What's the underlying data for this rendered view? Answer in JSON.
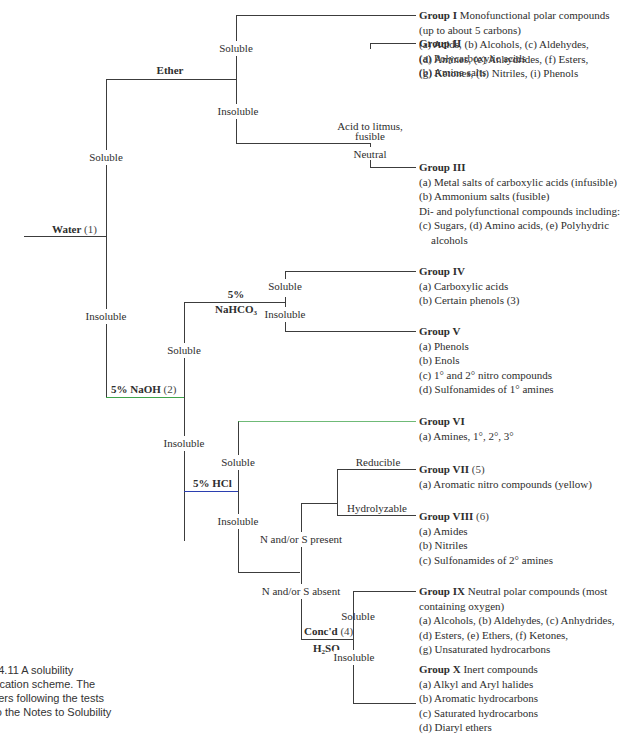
{
  "tests": {
    "water": {
      "name": "Water",
      "note": "(1)"
    },
    "ether": {
      "name": "Ether"
    },
    "naoh": {
      "name": "5% NaOH",
      "note": "(2)"
    },
    "nahco3": {
      "line1": "5%",
      "line2": "NaHCO",
      "sub": "3"
    },
    "hcl": {
      "name": "5% HCl"
    },
    "h2so4": {
      "line1": "Conc'd",
      "note": "(4)",
      "line2a": "H",
      "sub1": "2",
      "line2b": "SO",
      "sub2": "4"
    }
  },
  "branches": {
    "water_soluble": "Soluble",
    "water_insoluble": "Insoluble",
    "ether_soluble": "Soluble",
    "ether_insoluble": "Insoluble",
    "litmus_acid": "Acid to litmus,",
    "litmus_fusible": "fusible",
    "neutral": "Neutral",
    "naoh_soluble": "Soluble",
    "naoh_insoluble": "Insoluble",
    "nahco3_soluble": "Soluble",
    "nahco3_insoluble": "Insoluble",
    "hcl_soluble": "Soluble",
    "hcl_insoluble": "Insoluble",
    "ns_present": "N and/or S present",
    "ns_absent": "N and/or S absent",
    "reducible": "Reducible",
    "hydrolyzable": "Hydrolyzable",
    "h2so4_soluble": "Soluble",
    "h2so4_insoluble": "Insoluble"
  },
  "groups": [
    {
      "id": "I",
      "title": "Group I",
      "desc": " Monofunctional polar compounds",
      "lines": [
        "(up to about 5 carbons)",
        "(a) Acids, (b) Alcohols, (c) Aldehydes,",
        "(d) Amines, (e) Anhydrides, (f) Esters,",
        "(g) Ketones, (h) Nitriles, (i) Phenols"
      ]
    },
    {
      "id": "II",
      "title": "Group II",
      "desc": "",
      "lines": [
        "(a) Polycarboxylic acids",
        "(b) Amine salts"
      ]
    },
    {
      "id": "III",
      "title": "Group III",
      "desc": "",
      "lines": [
        "(a) Metal salts of carboxylic acids (infusible)",
        "(b) Ammonium salts (fusible)",
        "Di- and polyfunctional compounds including:",
        "(c) Sugars, (d) Amino acids, (e) Polyhydric",
        "alcohols"
      ]
    },
    {
      "id": "IV",
      "title": "Group IV",
      "desc": "",
      "lines": [
        "(a) Carboxylic acids",
        "(b) Certain phenols (3)"
      ]
    },
    {
      "id": "V",
      "title": "Group V",
      "desc": "",
      "lines": [
        "(a) Phenols",
        "(b) Enols",
        "(c) 1° and 2° nitro compounds",
        "(d) Sulfonamides of 1° amines"
      ]
    },
    {
      "id": "VI",
      "title": "Group VI",
      "desc": "",
      "lines": [
        "(a) Amines, 1°, 2°, 3°"
      ]
    },
    {
      "id": "VII",
      "title": "Group VII",
      "desc": " (5)",
      "lines": [
        "(a) Aromatic nitro compounds (yellow)"
      ]
    },
    {
      "id": "VIII",
      "title": "Group VIII",
      "desc": " (6)",
      "lines": [
        "(a) Amides",
        "(b) Nitriles",
        "(c) Sulfonamides of 2° amines"
      ]
    },
    {
      "id": "IX",
      "title": "Group IX",
      "desc": " Neutral polar compounds (most",
      "lines": [
        "containing oxygen)",
        "(a) Alcohols, (b) Aldehydes, (c) Anhydrides,",
        "(d) Esters, (e) Ethers, (f) Ketones,",
        "(g) Unsaturated hydrocarbons"
      ]
    },
    {
      "id": "X",
      "title": "Group X",
      "desc": " Inert compounds",
      "lines": [
        "(a) Alkyl and Aryl halides",
        "(b) Aromatic hydrocarbons",
        "(c) Saturated hydrocarbons",
        "(d) Diaryl ethers"
      ]
    }
  ],
  "caption": {
    "fig": ". 14.11",
    "text": "  A solubility sification scheme. The nbers following the tests r to the Notes to Solubility ts."
  },
  "caption_lines": [
    ". 14.11  A solubility",
    "sification scheme. The",
    "nbers following the tests",
    "r to the Notes to Solubility",
    "ts."
  ],
  "colors": {
    "line": "#3c3c3c",
    "naoh_line": "#3fa34a",
    "hcl_line": "#2b3fb0",
    "group_vi_line": "#6fbf73"
  }
}
